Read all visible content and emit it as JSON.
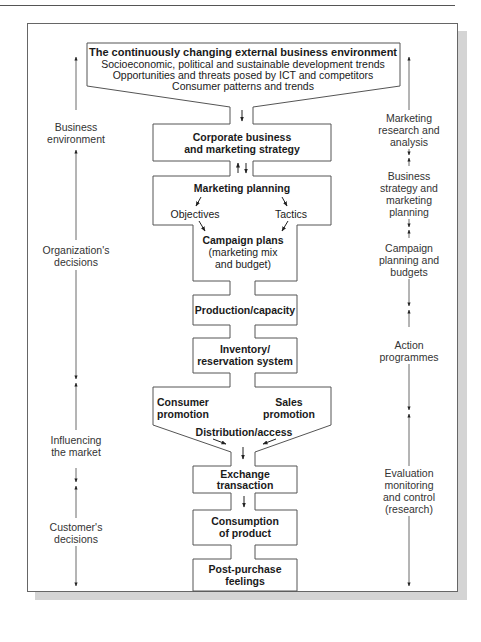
{
  "diagram": {
    "title": "The continuously changing external business environment",
    "environment_lines": [
      "Socioeconomic, political and sustainable development trends",
      "Opportunities and threats posed by ICT and competitors",
      "Consumer patterns and trends"
    ],
    "flow": {
      "corporate": [
        "Corporate business",
        "and marketing strategy"
      ],
      "marketing_planning": "Marketing planning",
      "objectives": "Objectives",
      "tactics": "Tactics",
      "campaign_plans": "Campaign plans",
      "campaign_sub": [
        "(marketing mix",
        "and budget)"
      ],
      "production": "Production/capacity",
      "inventory": [
        "Inventory/",
        "reservation system"
      ],
      "consumer_promotion": [
        "Consumer",
        "promotion"
      ],
      "sales_promotion": [
        "Sales",
        "promotion"
      ],
      "distribution": "Distribution/access",
      "exchange": [
        "Exchange",
        "transaction"
      ],
      "consumption": [
        "Consumption",
        "of product"
      ],
      "post_purchase": [
        "Post-purchase",
        "feelings"
      ]
    },
    "left_axis": [
      [
        "Business",
        "environment"
      ],
      [
        "Organization's",
        "decisions"
      ],
      [
        "Influencing",
        "the market"
      ],
      [
        "Customer's",
        "decisions"
      ]
    ],
    "right_axis": [
      [
        "Marketing",
        "research and",
        "analysis"
      ],
      [
        "Business",
        "strategy and",
        "marketing",
        "planning"
      ],
      [
        "Campaign",
        "planning and",
        "budgets"
      ],
      [
        "Action",
        "programmes"
      ],
      [
        "Evaluation",
        "monitoring",
        "and control",
        "(research)"
      ]
    ],
    "colors": {
      "line": "#555555",
      "shadow": "#d4d4d4",
      "text": "#1a1a1a"
    }
  }
}
